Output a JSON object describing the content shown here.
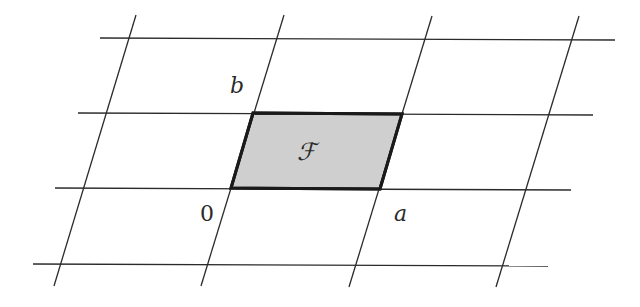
{
  "diagram": {
    "labels": {
      "origin": "0",
      "a": "a",
      "b": "b",
      "domain": "ℱ"
    },
    "lattice": {
      "horizontal_lines": 4,
      "slanted_lines": 4
    },
    "colors": {
      "line": "#2b2b2b",
      "domain_fill": "#cfcfcf",
      "domain_edge": "#1a1a1a",
      "background": "#ffffff"
    }
  }
}
